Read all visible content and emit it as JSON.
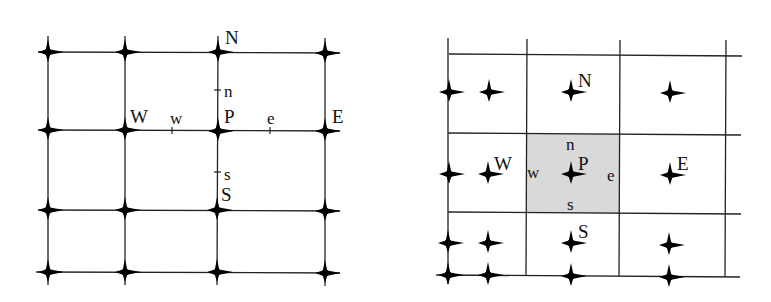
{
  "figure": {
    "left_panel": {
      "name": "grid-node-stencil",
      "vertical_lines_x": [
        48,
        125,
        218,
        325
      ],
      "horizontal_lines_y": [
        52,
        130,
        210,
        272
      ],
      "node_labels": {
        "N": "N",
        "W": "W",
        "P": "P",
        "E": "E",
        "S": "S"
      },
      "face_labels": {
        "n": "n",
        "w": "w",
        "e": "e",
        "s": "s"
      }
    },
    "right_panel": {
      "name": "control-volume-stencil",
      "vertical_faces_x": [
        448,
        527,
        620,
        725
      ],
      "horizontal_faces_y": [
        55,
        134,
        213,
        276
      ],
      "shaded_cell": {
        "x0": 527,
        "y0": 134,
        "x1": 620,
        "y1": 213,
        "color": "#d9d9d9"
      },
      "node_labels": {
        "N": "N",
        "W": "W",
        "P": "P",
        "E": "E",
        "S": "S"
      },
      "face_labels": {
        "n": "n",
        "w": "w",
        "e": "e",
        "s": "s"
      }
    },
    "colors": {
      "line": "#222222",
      "node": "#111111",
      "shade": "#d9d9d9",
      "background": "#ffffff"
    }
  }
}
